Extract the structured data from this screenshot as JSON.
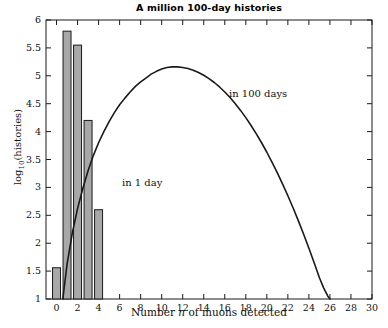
{
  "chart_data": {
    "type": "bar",
    "title": "A million 100-day histories",
    "xlabel": "Number n of muons detected",
    "ylabel": "log10(histories)",
    "xlim": [
      -1,
      30
    ],
    "ylim": [
      1,
      6
    ],
    "grid": false,
    "legend_position": "inline-annotations",
    "x_ticks": [
      0,
      2,
      4,
      6,
      8,
      10,
      12,
      14,
      16,
      18,
      20,
      22,
      24,
      26,
      28,
      30
    ],
    "x_tick_labels": [
      "0",
      "2",
      "4",
      "6",
      "8",
      "10",
      "12",
      "14",
      "16",
      "18",
      "20",
      "22",
      "24",
      "26",
      "28",
      "30"
    ],
    "y_ticks": [
      1,
      1.5,
      2,
      2.5,
      3,
      3.5,
      4,
      4.5,
      5,
      5.5,
      6
    ],
    "y_tick_labels": [
      "1",
      "1.5",
      "2",
      "2.5",
      "3",
      "3.5",
      "4",
      "4.5",
      "5",
      "5.5",
      "6"
    ],
    "series": [
      {
        "name": "in 1 day",
        "kind": "bar",
        "annotation": "in 1 day",
        "fill_color": "#a8a8a8",
        "edge_color": "#1a1a1a",
        "categories": [
          0,
          1,
          2,
          3,
          4
        ],
        "values": [
          1.56,
          5.8,
          5.55,
          4.2,
          2.6
        ]
      },
      {
        "name": "in 100 days",
        "kind": "line",
        "annotation": "in 100 days",
        "line_color": "#1a1a1a",
        "x": [
          0.6,
          1,
          1.5,
          2,
          2.5,
          3,
          3.5,
          4,
          4.5,
          5,
          5.5,
          6,
          6.5,
          7,
          7.5,
          8,
          8.5,
          9,
          9.5,
          10,
          10.5,
          11,
          11.5,
          12,
          12.5,
          13,
          13.5,
          14,
          14.5,
          15,
          15.5,
          16,
          16.5,
          17,
          17.5,
          18,
          18.5,
          19,
          19.5,
          20,
          20.5,
          21,
          21.5,
          22,
          22.5,
          23,
          23.5,
          24,
          24.5,
          25,
          25.4,
          25.8,
          26
        ],
        "y": [
          1.0,
          1.62,
          2.18,
          2.62,
          2.98,
          3.3,
          3.57,
          3.8,
          4.0,
          4.18,
          4.34,
          4.48,
          4.6,
          4.71,
          4.81,
          4.89,
          4.96,
          5.03,
          5.08,
          5.12,
          5.15,
          5.16,
          5.16,
          5.15,
          5.13,
          5.1,
          5.06,
          5.01,
          4.95,
          4.88,
          4.8,
          4.71,
          4.61,
          4.5,
          4.38,
          4.25,
          4.11,
          3.96,
          3.8,
          3.63,
          3.45,
          3.26,
          3.06,
          2.85,
          2.63,
          2.4,
          2.16,
          1.91,
          1.65,
          1.38,
          1.2,
          1.05,
          1.0
        ]
      }
    ]
  },
  "annotations": {
    "one_day": "in 1 day",
    "hundred_days": "in 100 days"
  },
  "axis_title_parts": {
    "y_prefix": "log",
    "y_sub": "10",
    "y_suffix": "(histories)",
    "x_before": "Number ",
    "x_italic": "n",
    "x_after": " of muons detected"
  }
}
